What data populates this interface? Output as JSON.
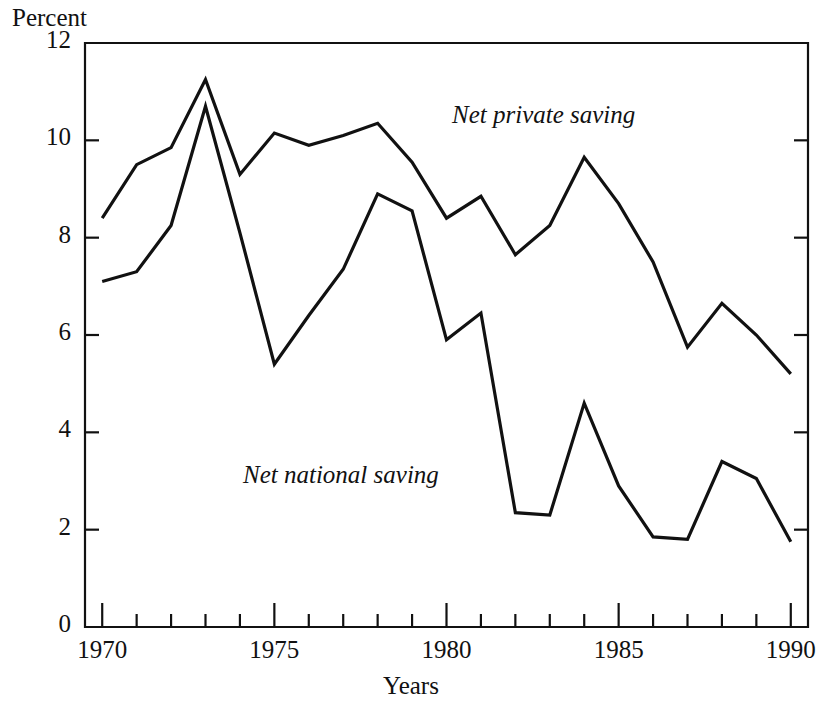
{
  "chart_data": {
    "type": "line",
    "title": "",
    "xlabel": "Years",
    "ylabel": "Percent",
    "xlim": [
      1969.5,
      1990.5
    ],
    "ylim": [
      0,
      12
    ],
    "grid": false,
    "legend_position": "inline-annotation",
    "x": [
      1970,
      1971,
      1972,
      1973,
      1974,
      1975,
      1976,
      1977,
      1978,
      1979,
      1980,
      1981,
      1982,
      1983,
      1984,
      1985,
      1986,
      1987,
      1988,
      1989,
      1990
    ],
    "xticks_major": [
      1970,
      1975,
      1980,
      1985,
      1990
    ],
    "xtick_labels": [
      "1970",
      "1975",
      "1980",
      "1985",
      "1990"
    ],
    "xticks_minor": [
      1971,
      1972,
      1973,
      1974,
      1976,
      1977,
      1978,
      1979,
      1981,
      1982,
      1983,
      1984,
      1986,
      1987,
      1988,
      1989
    ],
    "yticks": [
      0,
      2,
      4,
      6,
      8,
      10,
      12
    ],
    "ytick_labels": [
      "0",
      "2",
      "4",
      "6",
      "8",
      "10",
      "12"
    ],
    "series": [
      {
        "name": "Net private saving",
        "label_text": "Net private saving",
        "color": "#111111",
        "values": [
          8.4,
          9.5,
          9.85,
          11.25,
          9.3,
          10.15,
          9.9,
          10.1,
          10.35,
          9.55,
          8.4,
          8.85,
          7.65,
          8.25,
          9.65,
          8.7,
          7.5,
          5.75,
          6.65,
          6.0,
          5.2
        ]
      },
      {
        "name": "Net national saving",
        "label_text": "Net national saving",
        "color": "#111111",
        "values": [
          7.1,
          7.3,
          8.25,
          10.7,
          8.1,
          5.4,
          6.4,
          7.35,
          8.9,
          8.55,
          5.9,
          6.45,
          2.35,
          2.3,
          4.6,
          2.9,
          1.85,
          1.8,
          3.4,
          3.05,
          1.75
        ]
      }
    ]
  },
  "axes": {
    "ylabel_text": "Percent",
    "xlabel_text": "Years"
  }
}
